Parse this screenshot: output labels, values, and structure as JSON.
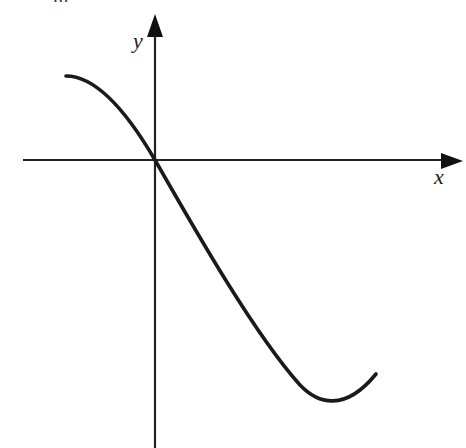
{
  "figure": {
    "clipped_header_text": "· − … ··",
    "axes": {
      "x_label": "x",
      "y_label": "y",
      "origin_px": [
        155,
        160
      ],
      "x_axis_px": {
        "start": 23,
        "end": 463
      },
      "y_axis_px": {
        "start": 14,
        "end": 448
      }
    },
    "curve": {
      "description": "Smooth curve decreasing from upper-left, passing through the origin, reaching a minimum in the lower-right, then rising",
      "points_px": [
        [
          66,
          76
        ],
        [
          100,
          88
        ],
        [
          125,
          115
        ],
        [
          155,
          160
        ],
        [
          217,
          270
        ],
        [
          250,
          320
        ],
        [
          300,
          388
        ],
        [
          333,
          405
        ],
        [
          376,
          374
        ]
      ],
      "stroke_color": "#1a1a1a"
    },
    "colors": {
      "axis": "#222222",
      "curve": "#1a1a1a",
      "background": "#ffffff"
    }
  }
}
